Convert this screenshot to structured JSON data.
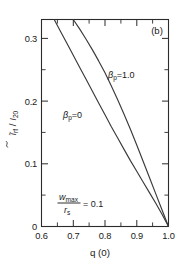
{
  "figure": {
    "panel_label": "(b)",
    "background_color": "#ffffff",
    "ink_color": "#2b2b2b"
  },
  "chart_data": {
    "type": "line",
    "title": "",
    "subtitle": "",
    "panel": "(b)",
    "xlabel": "q (0)",
    "ylabel": "ĩ_rf / I_20",
    "ylabel_parts": {
      "numerator": "ĩ",
      "numerator_sub": "rf",
      "denominator": "I",
      "denominator_sub": "20"
    },
    "xlim": [
      0.6,
      1.0
    ],
    "ylim": [
      0.0,
      0.33
    ],
    "xticks": [
      0.6,
      0.7,
      0.8,
      0.9,
      1.0
    ],
    "xticklabels": [
      "0.6",
      "0.7",
      "0.8",
      "0.9",
      "1.0"
    ],
    "yticks": [
      0.0,
      0.1,
      0.2,
      0.3
    ],
    "yticklabels": [
      "0",
      "0.1",
      "0.2",
      "0.3"
    ],
    "x_minor_interval": 0.05,
    "y_minor_interval": 0.05,
    "grid": false,
    "legend": "inline-annotations",
    "annotations": [
      {
        "name": "beta-p-zero-label",
        "text": "βp = 0",
        "symbol": "β",
        "subscript": "p",
        "value": "0",
        "x_frac": 0.2,
        "y_frac": 0.48
      },
      {
        "name": "beta-p-one-label",
        "text": "βp = 1.0",
        "symbol": "β",
        "subscript": "p",
        "value": "1.0",
        "x_frac": 0.56,
        "y_frac": 0.26
      },
      {
        "name": "wmax-rs-annotation",
        "numerator": "w",
        "numerator_sub": "max",
        "denominator": "r",
        "denominator_sub": "s",
        "relation": "= 0.1",
        "x_frac": 0.14,
        "y_frac": 0.79
      }
    ],
    "series": [
      {
        "name": "βp = 0",
        "label": "beta_p = 0",
        "x": [
          0.64,
          0.66,
          0.68,
          0.7,
          0.72,
          0.74,
          0.76,
          0.78,
          0.8,
          0.82,
          0.84,
          0.86,
          0.88,
          0.9,
          0.92,
          0.94,
          0.96,
          0.98,
          1.0
        ],
        "y": [
          0.33,
          0.311,
          0.292,
          0.273,
          0.254,
          0.235,
          0.216,
          0.197,
          0.178,
          0.159,
          0.141,
          0.123,
          0.105,
          0.088,
          0.071,
          0.054,
          0.037,
          0.019,
          0.0
        ]
      },
      {
        "name": "βp = 1.0",
        "label": "beta_p = 1.0",
        "x": [
          0.7,
          0.72,
          0.74,
          0.76,
          0.78,
          0.8,
          0.82,
          0.84,
          0.86,
          0.88,
          0.9,
          0.92,
          0.94,
          0.96,
          0.98,
          1.0
        ],
        "y": [
          0.33,
          0.315,
          0.299,
          0.282,
          0.264,
          0.245,
          0.224,
          0.202,
          0.179,
          0.155,
          0.13,
          0.104,
          0.078,
          0.052,
          0.026,
          0.0
        ]
      }
    ]
  }
}
